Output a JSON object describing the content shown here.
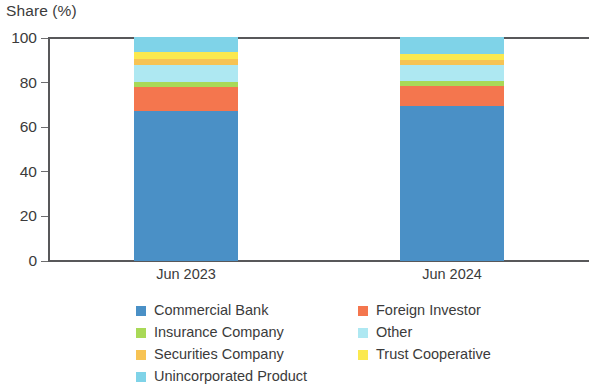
{
  "chart_data": {
    "type": "bar",
    "title": "",
    "subtitle": "",
    "ylabel": "Share (%)",
    "xlabel": "",
    "categories": [
      "Jun 2023",
      "Jun 2024"
    ],
    "ylim": [
      0,
      100
    ],
    "yticks": [
      0,
      20,
      40,
      60,
      80,
      100
    ],
    "ytick_labels": [
      "0",
      "20",
      "40",
      "60",
      "80",
      "100"
    ],
    "grid": false,
    "stacked": true,
    "legend_position": "bottom",
    "series": [
      {
        "name": "Commercial Bank",
        "color": "#4a90c6",
        "values": [
          67.3,
          69.5
        ]
      },
      {
        "name": "Foreign Investor",
        "color": "#f4764e",
        "values": [
          10.8,
          9.0
        ]
      },
      {
        "name": "Insurance Company",
        "color": "#a9d957",
        "values": [
          2.2,
          2.3
        ]
      },
      {
        "name": "Other",
        "color": "#aee8f2",
        "values": [
          7.5,
          7.2
        ]
      },
      {
        "name": "Securities Company",
        "color": "#f7c354",
        "values": [
          3.0,
          2.1
        ]
      },
      {
        "name": "Trust Cooperative",
        "color": "#fbe94f",
        "values": [
          2.9,
          2.7
        ]
      },
      {
        "name": "Unincorporated Product",
        "color": "#7fd3e8",
        "values": [
          6.3,
          7.2
        ]
      }
    ]
  },
  "axis": {
    "y_title": "Share (%)",
    "ticks": [
      {
        "label": "100",
        "value": 100
      },
      {
        "label": "80",
        "value": 80
      },
      {
        "label": "60",
        "value": 60
      },
      {
        "label": "40",
        "value": 40
      },
      {
        "label": "20",
        "value": 20
      },
      {
        "label": "0",
        "value": 0
      }
    ]
  },
  "bars": [
    {
      "label": "Jun 2023"
    },
    {
      "label": "Jun 2024"
    }
  ],
  "legend": {
    "left_column": [
      {
        "label": "Commercial Bank",
        "color": "#4a90c6"
      },
      {
        "label": "Insurance Company",
        "color": "#a9d957"
      },
      {
        "label": "Securities Company",
        "color": "#f7c354"
      },
      {
        "label": "Unincorporated Product",
        "color": "#7fd3e8"
      }
    ],
    "right_column": [
      {
        "label": "Foreign Investor",
        "color": "#f4764e"
      },
      {
        "label": "Other",
        "color": "#aee8f2"
      },
      {
        "label": "Trust Cooperative",
        "color": "#fbe94f"
      }
    ]
  }
}
